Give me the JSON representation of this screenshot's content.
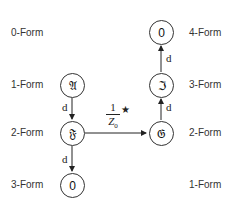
{
  "left_column": {
    "form_labels": [
      "0-Form",
      "1-Form",
      "2-Form",
      "3-Form"
    ],
    "nodes": [
      {
        "symbol": "𝔄",
        "form": "1-Form"
      },
      {
        "symbol": "𝔉",
        "form": "2-Form"
      },
      {
        "symbol": "0",
        "form": "3-Form"
      }
    ],
    "edges": [
      {
        "from": "𝔄",
        "to": "𝔉",
        "label": "d"
      },
      {
        "from": "𝔉",
        "to": "0",
        "label": "d"
      }
    ]
  },
  "right_column": {
    "form_labels": [
      "4-Form",
      "3-Form",
      "2-Form",
      "1-Form"
    ],
    "nodes": [
      {
        "symbol": "0",
        "form": "4-Form"
      },
      {
        "symbol": "ℑ",
        "form": "3-Form"
      },
      {
        "symbol": "𝔊",
        "form": "2-Form"
      }
    ],
    "edges": [
      {
        "from": "𝔊",
        "to": "ℑ",
        "label": "d"
      },
      {
        "from": "ℑ",
        "to": "0",
        "label": "d"
      }
    ]
  },
  "hodge_edge": {
    "from": "𝔉",
    "to": "𝔊",
    "numerator": "1",
    "denominator": "Z",
    "denominator_sub": "0",
    "operator": "★"
  }
}
